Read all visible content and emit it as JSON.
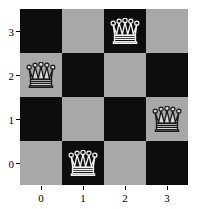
{
  "figure": {
    "background_color": "#ffffff",
    "dark_square_color": "#0d0d0d",
    "light_square_color": "#a8a8a8",
    "piece_icon": "chess-queen-icon"
  },
  "chart_data": {
    "type": "heatmap",
    "title": "",
    "xlabel": "",
    "ylabel": "",
    "xlim": [
      -0.5,
      3.5
    ],
    "ylim": [
      -0.5,
      3.5
    ],
    "grid": false,
    "legend": false,
    "x_tick_labels": [
      "0",
      "1",
      "2",
      "3"
    ],
    "y_tick_labels": [
      "3",
      "2",
      "1",
      "0"
    ],
    "x_tick_values": [
      0,
      1,
      2,
      3
    ],
    "y_tick_values": [
      3,
      2,
      1,
      0
    ],
    "board_size": 4,
    "cells": [
      [
        {
          "col": 0,
          "row": 3,
          "shade": "dark",
          "piece": null
        },
        {
          "col": 1,
          "row": 3,
          "shade": "light",
          "piece": null
        },
        {
          "col": 2,
          "row": 3,
          "shade": "dark",
          "piece": "queen"
        },
        {
          "col": 3,
          "row": 3,
          "shade": "light",
          "piece": null
        }
      ],
      [
        {
          "col": 0,
          "row": 2,
          "shade": "light",
          "piece": "queen"
        },
        {
          "col": 1,
          "row": 2,
          "shade": "dark",
          "piece": null
        },
        {
          "col": 2,
          "row": 2,
          "shade": "light",
          "piece": null
        },
        {
          "col": 3,
          "row": 2,
          "shade": "dark",
          "piece": null
        }
      ],
      [
        {
          "col": 0,
          "row": 1,
          "shade": "dark",
          "piece": null
        },
        {
          "col": 1,
          "row": 1,
          "shade": "light",
          "piece": null
        },
        {
          "col": 2,
          "row": 1,
          "shade": "dark",
          "piece": null
        },
        {
          "col": 3,
          "row": 1,
          "shade": "light",
          "piece": "queen"
        }
      ],
      [
        {
          "col": 0,
          "row": 0,
          "shade": "light",
          "piece": null
        },
        {
          "col": 1,
          "row": 0,
          "shade": "dark",
          "piece": "queen"
        },
        {
          "col": 2,
          "row": 0,
          "shade": "light",
          "piece": null
        },
        {
          "col": 3,
          "row": 0,
          "shade": "dark",
          "piece": null
        }
      ]
    ],
    "queen_positions": [
      {
        "col": 2,
        "row": 3
      },
      {
        "col": 0,
        "row": 2
      },
      {
        "col": 3,
        "row": 1
      },
      {
        "col": 1,
        "row": 0
      }
    ]
  }
}
